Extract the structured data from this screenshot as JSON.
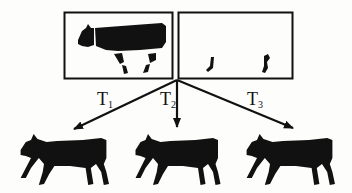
{
  "figure": {
    "source_panels": [
      {
        "id": "body-panel",
        "content": "cow body silhouette with separated leg segments"
      },
      {
        "id": "legs-panel",
        "content": "two isolated lower leg/hoof segments"
      }
    ],
    "transforms": [
      {
        "label": "T",
        "sub": "1"
      },
      {
        "label": "T",
        "sub": "2"
      },
      {
        "label": "T",
        "sub": "3"
      }
    ],
    "outputs": [
      {
        "id": "cow-pose-1"
      },
      {
        "id": "cow-pose-2"
      },
      {
        "id": "cow-pose-3"
      }
    ],
    "colors": {
      "ink": "#111111",
      "background": "#fdfdfb"
    }
  }
}
